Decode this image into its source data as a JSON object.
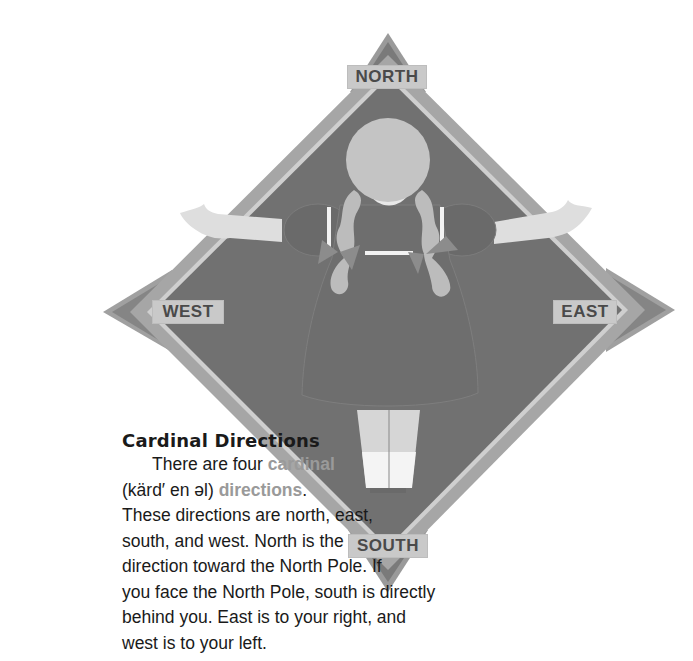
{
  "compass": {
    "labels": {
      "north": "NORTH",
      "south": "SOUTH",
      "east": "EAST",
      "west": "WEST"
    },
    "colors": {
      "diamond_fill": "#707070",
      "diamond_border": "#a8a8a8",
      "arrow_fill": "#8a8a8a",
      "label_bg": "#c9c9c9",
      "figure_skin": "#dcdcdc",
      "figure_hair": "#bdbdbd",
      "keyword_text": "#9a9a9a"
    }
  },
  "lesson": {
    "heading": "Cardinal Directions",
    "line1_prefix": "There are four ",
    "line1_keyword": "cardinal",
    "line2_pronunciation": "(kärd′ en əl) ",
    "line2_keyword": "directions",
    "line2_suffix": ".",
    "line3": "These directions are north, east,",
    "line4": "south, and west. North is the",
    "line5": "direction toward the North Pole. If",
    "line6": "you face the North Pole, south is directly",
    "line7": "behind you. East is to your right, and",
    "line8": "west is to your left."
  }
}
